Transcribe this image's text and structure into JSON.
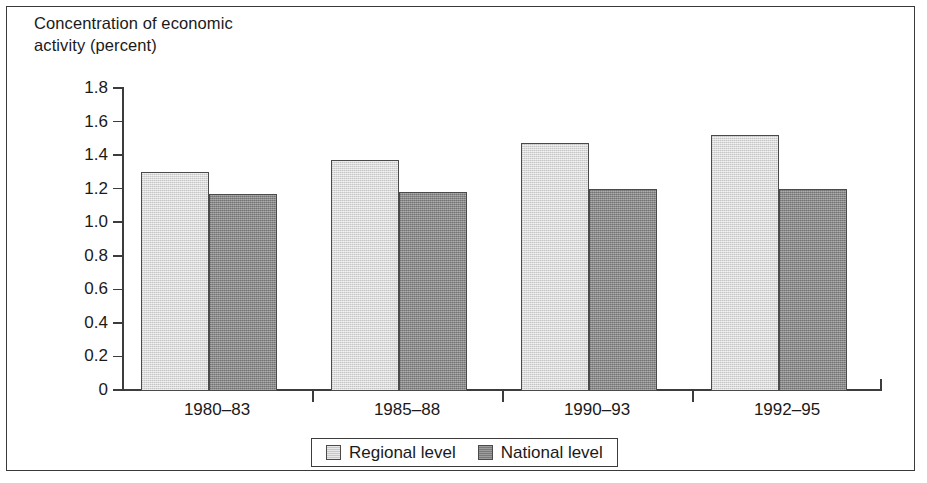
{
  "figure": {
    "axis_title_line1": "Concentration of economic",
    "axis_title_line2": "activity (percent)"
  },
  "colors": {
    "regional_fill": "#d2d2d2",
    "national_fill": "#848484",
    "bar_outline": "#4a4a4a",
    "axis": "#3c3c3c",
    "frame": "#3a3a3a",
    "text": "#1a1a1a",
    "background": "#ffffff"
  },
  "chart_data": {
    "type": "bar",
    "title": "",
    "subtitle": "",
    "xlabel": "",
    "ylabel": "Concentration of economic activity (percent)",
    "categories": [
      "1980–83",
      "1985–88",
      "1990–93",
      "1992–95"
    ],
    "series": [
      {
        "name": "Regional level",
        "values": [
          1.3,
          1.37,
          1.47,
          1.52
        ]
      },
      {
        "name": "National level",
        "values": [
          1.17,
          1.18,
          1.2,
          1.2
        ]
      }
    ],
    "ylim": [
      0,
      1.8
    ],
    "ytick_values": [
      0,
      0.2,
      0.4,
      0.6,
      0.8,
      1.0,
      1.2,
      1.4,
      1.6,
      1.8
    ],
    "ytick_labels": [
      "0",
      "0.2",
      "0.4",
      "0.6",
      "0.8",
      "1.0",
      "1.2",
      "1.4",
      "1.6",
      "1.8"
    ],
    "grid": false,
    "legend_position": "bottom",
    "legend_entries": [
      "Regional level",
      "National level"
    ]
  }
}
